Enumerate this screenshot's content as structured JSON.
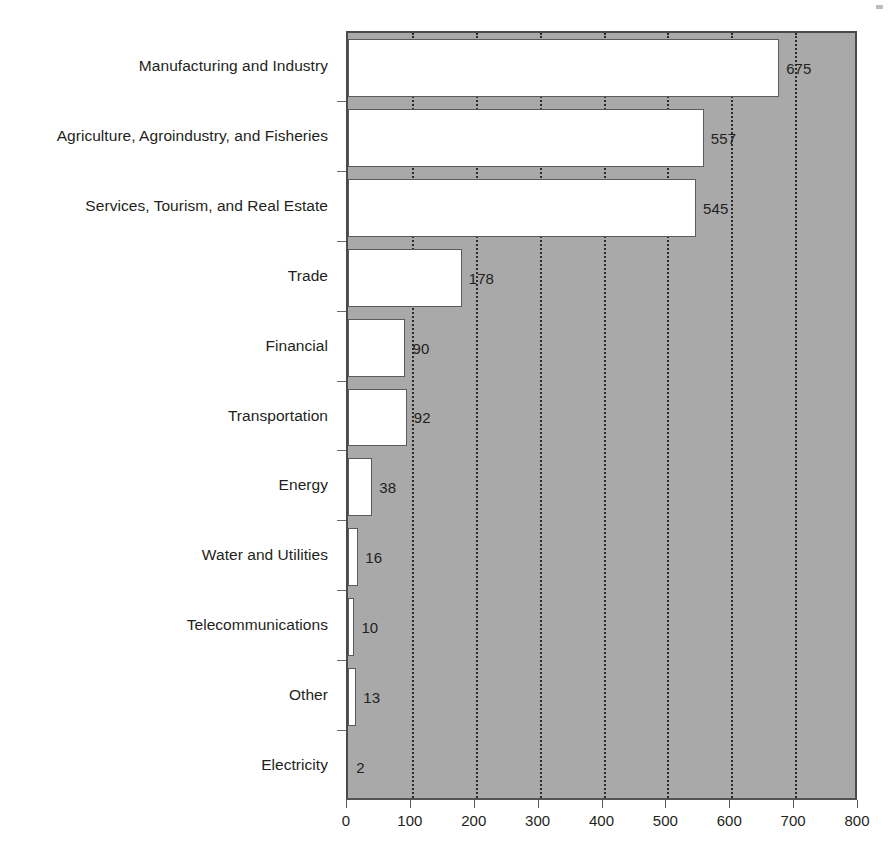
{
  "chart_data": {
    "type": "bar",
    "orientation": "horizontal",
    "title": "",
    "subtitle": "",
    "xlabel": "",
    "ylabel": "",
    "xlim": [
      0,
      800
    ],
    "xticks": [
      0,
      100,
      200,
      300,
      400,
      500,
      600,
      700,
      800
    ],
    "xtick_labels": [
      "0",
      "100",
      "200",
      "300",
      "400",
      "500",
      "600",
      "700",
      "800"
    ],
    "grid": "vertical-dotted",
    "legend": "none",
    "plot_background": "#a9a9a9",
    "bar_fill": "#ffffff",
    "bar_edge": "#5d5a5a",
    "categories": [
      "Manufacturing and Industry",
      "Agriculture, Agroindustry, and Fisheries",
      "Services, Tourism, and Real Estate",
      "Trade",
      "Financial",
      "Transportation",
      "Energy",
      "Water and Utilities",
      "Telecommunications",
      "Other",
      "Electricity"
    ],
    "values": [
      675,
      557,
      545,
      178,
      90,
      92,
      38,
      16,
      10,
      13,
      2
    ],
    "value_labels": [
      "675",
      "557",
      "545",
      "178",
      "90",
      "92",
      "38",
      "16",
      "10",
      "13",
      "2"
    ]
  }
}
